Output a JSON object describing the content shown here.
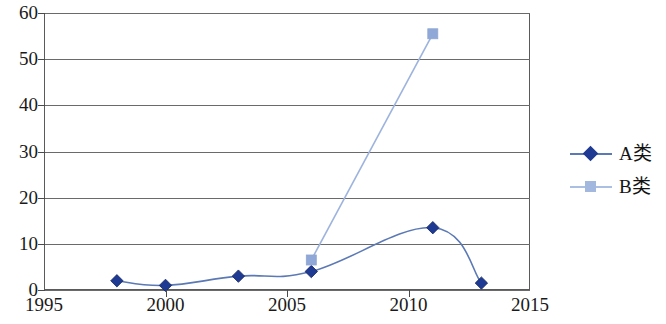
{
  "chart_data": {
    "type": "line",
    "title": "",
    "xlabel": "",
    "ylabel": "",
    "xlim": [
      1995,
      2015
    ],
    "ylim": [
      0,
      60
    ],
    "xticks": [
      "1995",
      "2000",
      "2005",
      "2010",
      "2015"
    ],
    "yticks": [
      "0",
      "10",
      "20",
      "30",
      "40",
      "50",
      "60"
    ],
    "grid": "horizontal",
    "legend_position": "right",
    "smooth": true,
    "series": [
      {
        "name": "A类",
        "color": "#1f3a93",
        "line_color": "#5b79b5",
        "marker": "diamond",
        "x": [
          1998,
          2000,
          2003,
          2006,
          2011,
          2013
        ],
        "values": [
          2,
          1,
          3,
          4,
          13.5,
          1.5
        ]
      },
      {
        "name": "B类",
        "color": "#8fa8d8",
        "line_color": "#9db3dd",
        "marker": "square",
        "x": [
          2006,
          2011
        ],
        "values": [
          6.5,
          55.5
        ]
      }
    ]
  },
  "legend": {
    "items": [
      {
        "label": "A类",
        "marker": "diamond-marker",
        "color": "#1f3a93",
        "line_color": "#5b79b5"
      },
      {
        "label": "B类",
        "marker": "square-marker",
        "color": "#a3b8de",
        "line_color": "#aabfe2"
      }
    ]
  },
  "axes": {
    "y_labels": [
      "60",
      "50",
      "40",
      "30",
      "20",
      "10",
      "0"
    ],
    "x_labels": [
      "1995",
      "2000",
      "2005",
      "2010",
      "2015"
    ]
  },
  "colors": {
    "series_a": "#1f3a93",
    "series_a_line": "#5b79b5",
    "series_b": "#a3b8de",
    "series_b_line": "#aabfe2",
    "axis": "#5a5a5a",
    "grid": "#6a6a6a",
    "text": "#1a1a1a",
    "background": "#ffffff"
  }
}
